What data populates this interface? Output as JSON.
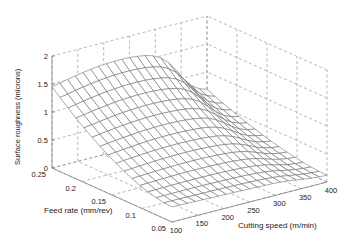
{
  "chart_data": {
    "type": "surface3d",
    "title": "",
    "xlabel": "Cutting speed (m/min)",
    "ylabel": "Feed rate (mm/rev)",
    "zlabel": "Surface roughness (microns)",
    "x_ticks": [
      "100",
      "150",
      "200",
      "250",
      "300",
      "350",
      "400"
    ],
    "y_ticks": [
      "0.05",
      "0.1",
      "0.15",
      "0.2",
      "0.25"
    ],
    "z_ticks": [
      "0",
      "0.5",
      "1",
      "1.5",
      "2"
    ],
    "xlim": [
      100,
      400
    ],
    "ylim": [
      0.05,
      0.25
    ],
    "zlim": [
      0,
      2
    ],
    "grid": true,
    "grid_style": "dashed",
    "mesh_size": [
      21,
      16
    ],
    "sample_points": [
      {
        "speed": 100,
        "feed": 0.25,
        "roughness": 1.38
      },
      {
        "speed": 250,
        "feed": 0.25,
        "roughness": 1.5
      },
      {
        "speed": 330,
        "feed": 0.25,
        "roughness": 1.6
      },
      {
        "speed": 400,
        "feed": 0.25,
        "roughness": 0.9
      },
      {
        "speed": 100,
        "feed": 0.15,
        "roughness": 0.9
      },
      {
        "speed": 250,
        "feed": 0.15,
        "roughness": 0.55
      },
      {
        "speed": 400,
        "feed": 0.15,
        "roughness": 0.35
      },
      {
        "speed": 100,
        "feed": 0.05,
        "roughness": 0.25
      },
      {
        "speed": 250,
        "feed": 0.05,
        "roughness": 0.15
      },
      {
        "speed": 400,
        "feed": 0.05,
        "roughness": 0.2
      }
    ]
  }
}
